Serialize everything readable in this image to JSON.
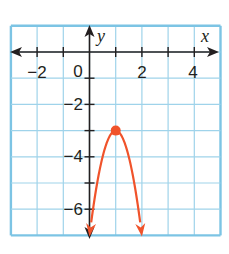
{
  "chart_data": {
    "type": "line",
    "title": "",
    "xlabel": "x",
    "ylabel": "y",
    "xlim": [
      -3,
      5
    ],
    "ylim": [
      -7,
      1
    ],
    "grid": true,
    "x_ticks": [
      -2,
      0,
      2,
      4
    ],
    "y_ticks": [
      -2,
      -4,
      -6
    ],
    "x_tick_labels": [
      "−2",
      "0",
      "2",
      "4"
    ],
    "y_tick_labels": [
      "−2",
      "−4",
      "−6"
    ],
    "series": [
      {
        "name": "parabola",
        "equation": "y = -4(x - 1)^2 - 3",
        "vertex": [
          1,
          -3
        ],
        "points": [
          [
            0,
            -7
          ],
          [
            0.5,
            -4
          ],
          [
            1,
            -3
          ],
          [
            1.5,
            -4
          ],
          [
            2,
            -7
          ]
        ],
        "arrows_at_ends": true
      }
    ],
    "highlighted_point": {
      "label": "vertex",
      "x": 1,
      "y": -3
    }
  },
  "colors": {
    "grid": "#9fd3ea",
    "border": "#7cc4e4",
    "axis": "#231f20",
    "curve": "#f0532b",
    "text": "#231f20"
  },
  "labels": {
    "x_axis": "x",
    "y_axis": "y",
    "origin": "0",
    "x_neg2": "−2",
    "x_2": "2",
    "x_4": "4",
    "y_neg2": "−2",
    "y_neg4": "−4",
    "y_neg6": "−6"
  }
}
